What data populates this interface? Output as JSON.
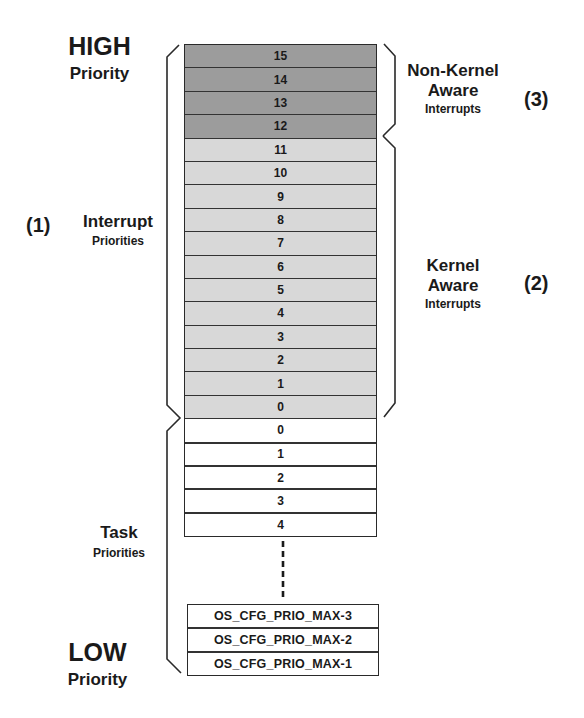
{
  "labels": {
    "high_title": "HIGH",
    "high_sub": "Priority",
    "low_title": "LOW",
    "low_sub": "Priority",
    "interrupt_num": "(1)",
    "interrupt_title": "Interrupt",
    "interrupt_sub": "Priorities",
    "task_title": "Task",
    "task_sub": "Priorities",
    "nonkernel_line1": "Non-Kernel",
    "nonkernel_line2": "Aware",
    "nonkernel_sub": "Interrupts",
    "nonkernel_num": "(3)",
    "kernel_line1": "Kernel",
    "kernel_line2": "Aware",
    "kernel_sub": "Interrupts",
    "kernel_num": "(2)"
  },
  "colors": {
    "non_kernel_fill": "#9c9c9c",
    "kernel_fill": "#d8d8d8",
    "task_fill": "#ffffff",
    "line": "#2a2a2a"
  },
  "interrupt_rows": [
    {
      "label": "15",
      "group": "nonkernel"
    },
    {
      "label": "14",
      "group": "nonkernel"
    },
    {
      "label": "13",
      "group": "nonkernel"
    },
    {
      "label": "12",
      "group": "nonkernel"
    },
    {
      "label": "11",
      "group": "kernel"
    },
    {
      "label": "10",
      "group": "kernel"
    },
    {
      "label": "9",
      "group": "kernel"
    },
    {
      "label": "8",
      "group": "kernel"
    },
    {
      "label": "7",
      "group": "kernel"
    },
    {
      "label": "6",
      "group": "kernel"
    },
    {
      "label": "5",
      "group": "kernel"
    },
    {
      "label": "4",
      "group": "kernel"
    },
    {
      "label": "3",
      "group": "kernel"
    },
    {
      "label": "2",
      "group": "kernel"
    },
    {
      "label": "1",
      "group": "kernel"
    },
    {
      "label": "0",
      "group": "kernel"
    }
  ],
  "task_rows": [
    {
      "label": "0"
    },
    {
      "label": "1"
    },
    {
      "label": "2"
    },
    {
      "label": "3"
    },
    {
      "label": "4"
    }
  ],
  "max_rows": [
    {
      "label": "OS_CFG_PRIO_MAX-3"
    },
    {
      "label": "OS_CFG_PRIO_MAX-2"
    },
    {
      "label": "OS_CFG_PRIO_MAX-1"
    }
  ]
}
